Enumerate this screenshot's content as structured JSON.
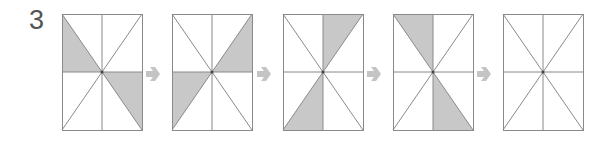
{
  "problem_number": "3",
  "colors": {
    "line": "#8a8a8a",
    "shade": "#c8c8c8",
    "arrow": "#c4c4c4",
    "text": "#555555"
  },
  "panels": [
    {
      "id": 1,
      "x": 62,
      "shaded": [
        "top-left-lower",
        "bottom-right-upper"
      ]
    },
    {
      "id": 2,
      "x": 172,
      "shaded": [
        "top-right-lower",
        "bottom-left-upper"
      ]
    },
    {
      "id": 3,
      "x": 283,
      "shaded": [
        "top-right-left",
        "bottom-left-right"
      ]
    },
    {
      "id": 4,
      "x": 393,
      "shaded": [
        "top-left-right",
        "bottom-right-left"
      ]
    },
    {
      "id": 5,
      "x": 503,
      "shaded": []
    }
  ],
  "arrows": [
    {
      "x": 152
    },
    {
      "x": 263
    },
    {
      "x": 373
    },
    {
      "x": 483
    }
  ],
  "panel_geometry": {
    "width": 80,
    "top": 14,
    "height": 116
  }
}
